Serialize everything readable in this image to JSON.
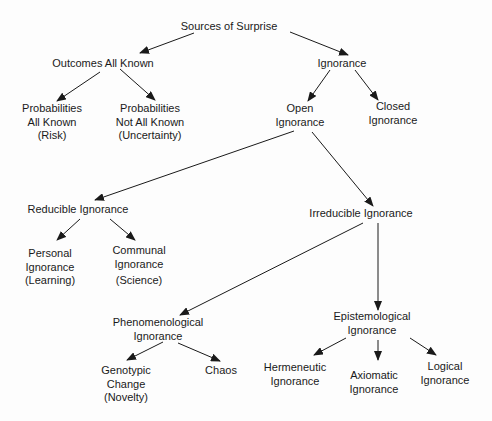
{
  "diagram": {
    "title": "Sources of Surprise",
    "colors": {
      "text": "#1a1a1a",
      "edge": "#1a1a1a",
      "background": "#fdfdfd"
    },
    "nodes": {
      "root": {
        "lines": [
          "Sources of Surprise"
        ],
        "x": 229,
        "y": 20
      },
      "outcomes_known": {
        "lines": [
          "Outcomes All Known"
        ],
        "x": 103,
        "y": 57
      },
      "ignorance": {
        "lines": [
          "Ignorance"
        ],
        "x": 342,
        "y": 57
      },
      "prob_known": {
        "lines": [
          "Probabilities",
          "All Known",
          "(Risk)"
        ],
        "x": 52,
        "y": 102
      },
      "prob_not_known": {
        "lines": [
          "Probabilities",
          "Not All Known",
          "(Uncertainty)"
        ],
        "x": 150,
        "y": 102
      },
      "open_ignorance": {
        "lines": [
          "Open",
          "Ignorance"
        ],
        "x": 300,
        "y": 102
      },
      "closed_ignorance": {
        "lines": [
          "Closed",
          "Ignorance"
        ],
        "x": 393,
        "y": 100
      },
      "reducible": {
        "lines": [
          "Reducible Ignorance"
        ],
        "x": 78,
        "y": 203
      },
      "irreducible": {
        "lines": [
          "Irreducible Ignorance"
        ],
        "x": 361,
        "y": 207
      },
      "personal": {
        "lines": [
          "Personal",
          "Ignorance",
          "(Learning)"
        ],
        "x": 50,
        "y": 247
      },
      "communal": {
        "lines": [
          "Communal",
          "Ignorance",
          "(Science)"
        ],
        "x": 139,
        "y": 244
      },
      "phenomenological": {
        "lines": [
          "Phenomenological",
          "Ignorance"
        ],
        "x": 158,
        "y": 316
      },
      "epistemological": {
        "lines": [
          "Epistemological",
          "Ignorance"
        ],
        "x": 372,
        "y": 310
      },
      "genotypic": {
        "lines": [
          "Genotypic",
          "Change",
          "(Novelty)"
        ],
        "x": 126,
        "y": 364
      },
      "chaos": {
        "lines": [
          "Chaos"
        ],
        "x": 221,
        "y": 364
      },
      "hermeneutic": {
        "lines": [
          "Hermeneutic",
          "Ignorance"
        ],
        "x": 295,
        "y": 361
      },
      "axiomatic": {
        "lines": [
          "Axiomatic",
          "Ignorance"
        ],
        "x": 374,
        "y": 369
      },
      "logical": {
        "lines": [
          "Logical",
          "Ignorance"
        ],
        "x": 445,
        "y": 360
      }
    },
    "edges": [
      {
        "from": "root",
        "to": "outcomes_known",
        "x1": 194,
        "y1": 33,
        "x2": 140,
        "y2": 53
      },
      {
        "from": "root",
        "to": "ignorance",
        "x1": 290,
        "y1": 32,
        "x2": 348,
        "y2": 55
      },
      {
        "from": "outcomes_known",
        "to": "prob_known",
        "x1": 100,
        "y1": 72,
        "x2": 57,
        "y2": 101
      },
      {
        "from": "outcomes_known",
        "to": "prob_not_known",
        "x1": 120,
        "y1": 69,
        "x2": 155,
        "y2": 100
      },
      {
        "from": "ignorance",
        "to": "open_ignorance",
        "x1": 330,
        "y1": 70,
        "x2": 308,
        "y2": 101
      },
      {
        "from": "ignorance",
        "to": "closed_ignorance",
        "x1": 355,
        "y1": 70,
        "x2": 378,
        "y2": 100
      },
      {
        "from": "open_ignorance",
        "to": "reducible",
        "x1": 294,
        "y1": 131,
        "x2": 95,
        "y2": 200
      },
      {
        "from": "open_ignorance",
        "to": "irreducible",
        "x1": 312,
        "y1": 132,
        "x2": 373,
        "y2": 206
      },
      {
        "from": "reducible",
        "to": "personal",
        "x1": 80,
        "y1": 219,
        "x2": 57,
        "y2": 240
      },
      {
        "from": "reducible",
        "to": "communal",
        "x1": 110,
        "y1": 219,
        "x2": 135,
        "y2": 240
      },
      {
        "from": "irreducible",
        "to": "phenomenological",
        "x1": 363,
        "y1": 223,
        "x2": 180,
        "y2": 315
      },
      {
        "from": "irreducible",
        "to": "epistemological",
        "x1": 378,
        "y1": 223,
        "x2": 378,
        "y2": 310
      },
      {
        "from": "phenomenological",
        "to": "genotypic",
        "x1": 163,
        "y1": 342,
        "x2": 127,
        "y2": 360
      },
      {
        "from": "phenomenological",
        "to": "chaos",
        "x1": 178,
        "y1": 343,
        "x2": 220,
        "y2": 361
      },
      {
        "from": "epistemological",
        "to": "hermeneutic",
        "x1": 346,
        "y1": 338,
        "x2": 314,
        "y2": 355
      },
      {
        "from": "epistemological",
        "to": "axiomatic",
        "x1": 378,
        "y1": 340,
        "x2": 378,
        "y2": 360
      },
      {
        "from": "epistemological",
        "to": "logical",
        "x1": 410,
        "y1": 338,
        "x2": 436,
        "y2": 355
      }
    ]
  }
}
